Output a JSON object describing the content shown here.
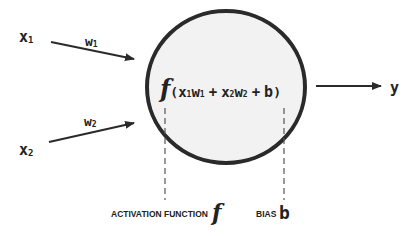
{
  "diagram": {
    "inputs": [
      {
        "label": "x",
        "sub": "1",
        "weight": "w",
        "weight_sub": "1"
      },
      {
        "label": "x",
        "sub": "2",
        "weight": "w",
        "weight_sub": "2"
      }
    ],
    "neuron": {
      "func": "f",
      "open": "(",
      "t1": "x",
      "t1s": "1",
      "t1w": "w",
      "t1ws": "1",
      "plus1": "+",
      "t2": "x",
      "t2s": "2",
      "t2w": "w",
      "t2ws": "2",
      "plus2": "+",
      "bias": "b",
      "close": ")"
    },
    "output": {
      "label": "y"
    },
    "annotations": {
      "activation_label": "ACTIVATION FUNCTION",
      "activation_symbol": "f",
      "bias_label": "BIAS",
      "bias_symbol": "b"
    },
    "colors": {
      "stroke": "#2a2a2a",
      "fill": "#f2f2f2",
      "text": "#222222"
    }
  }
}
